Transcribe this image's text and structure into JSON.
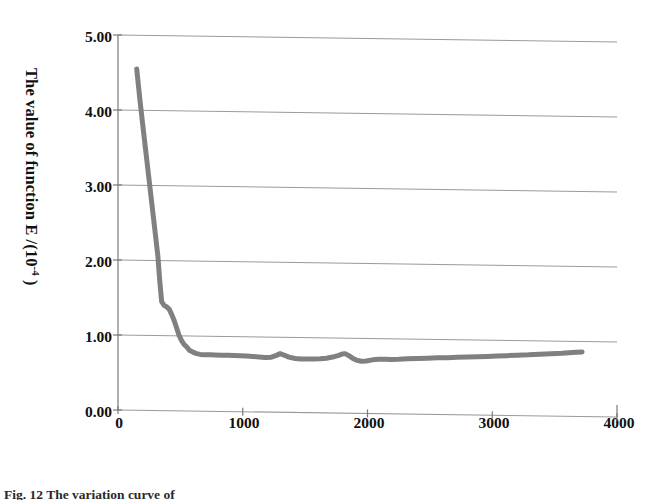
{
  "figure": {
    "caption": "Fig. 12   The variation curve of",
    "curve_color": "#808080",
    "axis_color": "#7a7a7a",
    "grid_color": "#9a9a9a",
    "background": "#ffffff"
  },
  "chart_data": {
    "type": "line",
    "title": "",
    "subtitle": "",
    "xlabel": "Time/ms",
    "ylabel": "The value of function E /(10−4 )",
    "ylabel_text": "The value of function E /(10",
    "ylabel_exponent": "-4",
    "ylabel_tail": " )",
    "xlim": [
      0,
      4000
    ],
    "ylim": [
      0,
      5
    ],
    "xticks": [
      0,
      1000,
      2000,
      3000,
      4000
    ],
    "xticklabels": [
      "0",
      "1000",
      "2000",
      "3000",
      "4000"
    ],
    "yticks": [
      0,
      1,
      2,
      3,
      4,
      5
    ],
    "yticklabels": [
      "0.00",
      "1.00",
      "2.00",
      "3.00",
      "4.00",
      "5.00"
    ],
    "grid": "horizontal",
    "legend": "none",
    "series": [
      {
        "name": "E",
        "color": "#808080",
        "linewidth": 5,
        "x": [
          150,
          175,
          200,
          225,
          250,
          275,
          300,
          320,
          335,
          350,
          370,
          390,
          410,
          430,
          450,
          470,
          490,
          510,
          530,
          550,
          575,
          600,
          630,
          660,
          700,
          740,
          780,
          830,
          880,
          930,
          980,
          1030,
          1080,
          1130,
          1180,
          1230,
          1270,
          1300,
          1330,
          1370,
          1420,
          1470,
          1520,
          1570,
          1620,
          1670,
          1720,
          1770,
          1800,
          1820,
          1850,
          1880,
          1910,
          1950,
          1990,
          2040,
          2090,
          2140,
          2190,
          2250,
          2320,
          2400,
          2480,
          2560,
          2640,
          2720,
          2800,
          2880,
          2960,
          3040,
          3120,
          3200,
          3290,
          3380,
          3470,
          3560,
          3640,
          3720
        ],
        "y": [
          4.55,
          4.15,
          3.78,
          3.42,
          3.06,
          2.7,
          2.34,
          2.05,
          1.72,
          1.45,
          1.4,
          1.38,
          1.35,
          1.28,
          1.2,
          1.1,
          1.0,
          0.93,
          0.88,
          0.85,
          0.8,
          0.78,
          0.76,
          0.75,
          0.745,
          0.745,
          0.745,
          0.742,
          0.74,
          0.738,
          0.735,
          0.732,
          0.728,
          0.722,
          0.716,
          0.72,
          0.745,
          0.768,
          0.75,
          0.722,
          0.705,
          0.7,
          0.698,
          0.7,
          0.705,
          0.712,
          0.728,
          0.752,
          0.77,
          0.775,
          0.748,
          0.715,
          0.69,
          0.675,
          0.678,
          0.695,
          0.702,
          0.705,
          0.702,
          0.705,
          0.712,
          0.718,
          0.722,
          0.728,
          0.732,
          0.738,
          0.742,
          0.748,
          0.752,
          0.758,
          0.765,
          0.772,
          0.778,
          0.788,
          0.795,
          0.802,
          0.812,
          0.822
        ]
      }
    ]
  }
}
